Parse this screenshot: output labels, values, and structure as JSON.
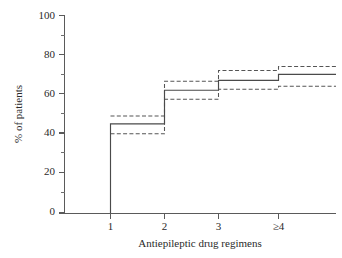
{
  "chart_data": {
    "type": "line",
    "title": "",
    "xlabel": "Antiepileptic drug regimens",
    "ylabel": "% of patients",
    "categories": [
      "1",
      "2",
      "3",
      "≥4"
    ],
    "x_tick_labels": [
      "1",
      "2",
      "3",
      "≥4"
    ],
    "y_tick_labels": [
      "0",
      "20",
      "40",
      "60",
      "80",
      "100"
    ],
    "y_major_ticks": [
      0,
      20,
      40,
      60,
      80,
      100
    ],
    "y_minor_ticks": [
      10,
      30,
      50,
      70,
      90
    ],
    "ylim": [
      0,
      100
    ],
    "grid": false,
    "legend": "none",
    "step_style": "post",
    "series": [
      {
        "name": "Cumulative % of patients seizure free",
        "style": "solid",
        "values": [
          45,
          62,
          67,
          70
        ]
      },
      {
        "name": "Upper 95% confidence limit",
        "style": "dashed",
        "values": [
          49,
          66.5,
          72,
          74
        ]
      },
      {
        "name": "Lower 95% confidence limit",
        "style": "dashed",
        "values": [
          40,
          57.5,
          62.5,
          64
        ]
      }
    ],
    "annotations": []
  },
  "axes": {
    "y_axis_name": "percent-of-patients-axis",
    "x_axis_name": "drug-regimens-axis"
  }
}
